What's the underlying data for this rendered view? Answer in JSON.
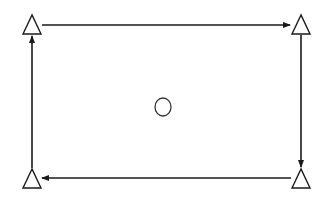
{
  "diagram": {
    "type": "cycle",
    "colors": {
      "stroke": "#1a1a1a",
      "fill": "#ffffff",
      "background": "#ffffff"
    },
    "nodes": [
      {
        "id": "top-left",
        "shape": "triangle",
        "cx": 32,
        "apex_y": 15,
        "base_y": 34,
        "half_width": 9
      },
      {
        "id": "top-right",
        "shape": "triangle",
        "cx": 301,
        "apex_y": 15,
        "base_y": 34,
        "half_width": 9
      },
      {
        "id": "bottom-right",
        "shape": "triangle",
        "cx": 301,
        "apex_y": 169,
        "base_y": 188,
        "half_width": 9
      },
      {
        "id": "bottom-left",
        "shape": "triangle",
        "cx": 32,
        "apex_y": 169,
        "base_y": 188,
        "half_width": 9
      }
    ],
    "center": {
      "shape": "circle",
      "cx": 163,
      "cy": 107,
      "rx": 8,
      "ry": 9
    },
    "edges": [
      {
        "from": "top-left",
        "to": "top-right",
        "direction": "right"
      },
      {
        "from": "top-right",
        "to": "bottom-right",
        "direction": "down"
      },
      {
        "from": "bottom-right",
        "to": "bottom-left",
        "direction": "left"
      },
      {
        "from": "bottom-left",
        "to": "top-left",
        "direction": "up"
      }
    ]
  }
}
